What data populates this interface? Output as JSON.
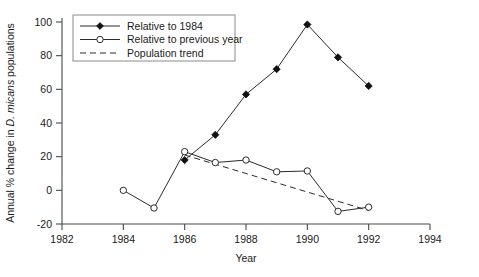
{
  "chart_data": {
    "type": "line",
    "title": "",
    "xlabel": "Year",
    "ylabel": "Annual % change in D. micans populations",
    "ylabel_parts": {
      "before": "Annual % change in ",
      "italic": "D. micans",
      "after": " populations"
    },
    "xlim": [
      1982,
      1994
    ],
    "ylim": [
      -20,
      100
    ],
    "xticks": [
      1982,
      1984,
      1986,
      1988,
      1990,
      1992,
      1994
    ],
    "xtick_labels": [
      "1982",
      "1984",
      "1986",
      "1988",
      "1990",
      "1992",
      "1994"
    ],
    "yticks": [
      -20,
      0,
      20,
      40,
      60,
      80,
      100
    ],
    "ytick_labels": [
      "-20",
      "0",
      "20",
      "40",
      "60",
      "80",
      "100"
    ],
    "grid": false,
    "legend_position": "top-left",
    "series": [
      {
        "name": "Relative to 1984",
        "marker": "filled-diamond",
        "linestyle": "solid",
        "x": [
          1986,
          1987,
          1988,
          1989,
          1990,
          1991,
          1992
        ],
        "values": [
          18,
          33,
          57,
          72,
          98.5,
          79,
          62
        ]
      },
      {
        "name": "Relative to previous year",
        "marker": "open-circle",
        "linestyle": "solid",
        "x": [
          1984,
          1985,
          1986,
          1987,
          1988,
          1989,
          1990,
          1991,
          1992
        ],
        "values": [
          0,
          -10.5,
          23,
          16.5,
          18,
          11,
          11.5,
          -12.5,
          -10
        ]
      },
      {
        "name": "Population trend",
        "marker": "none",
        "linestyle": "dashed",
        "x": [
          1986,
          1992
        ],
        "values": [
          21,
          -12
        ]
      }
    ]
  },
  "legend": {
    "entries": [
      {
        "label": "Relative to 1984",
        "marker": "filled-diamond",
        "linestyle": "solid"
      },
      {
        "label": "Relative to previous year",
        "marker": "open-circle",
        "linestyle": "solid"
      },
      {
        "label": "Population trend",
        "marker": "none",
        "linestyle": "dashed"
      }
    ]
  },
  "axes": {
    "x_title": "Year",
    "y_title_before": "Annual % change in ",
    "y_title_italic": "D. micans",
    "y_title_after": " populations"
  },
  "colors": {
    "background": "#ffffff",
    "axis": "#4a4a4a",
    "line": "#2b2b2b",
    "marker_fill": "#111111",
    "marker_open": "#ffffff",
    "text": "#1a1a1a",
    "legend_border": "#8a8a8a"
  }
}
